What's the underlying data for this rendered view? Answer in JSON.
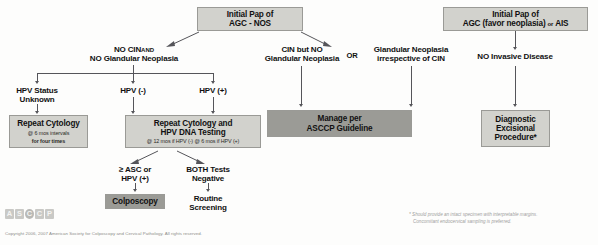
{
  "document": {
    "title": "Management of Women with Atypical Glandular Cells (AGC)",
    "type": "clinical-algorithm-flowchart"
  },
  "nodes": {
    "agc_nos": {
      "title_line1": "Initial Pap of",
      "title_line2": "AGC - NOS"
    },
    "agc_favor": {
      "title_line1": "Initial Pap of",
      "title_line2_a": "AGC (favor neoplasia)",
      "title_line2_or": "or",
      "title_line2_b": "AIS"
    },
    "repeat_cytology": {
      "title": "Repeat Cytology",
      "sub1": "@ 6 mos intervals",
      "sub2": "for four times"
    },
    "repeat_cytology_hpv": {
      "title_line1": "Repeat Cytology and",
      "title_line2": "HPV DNA Testing",
      "sub": "@ 12 mos if HPV (-)   @ 6 mos if HPV (+)"
    },
    "colposcopy": {
      "title": "Colposcopy"
    },
    "manage_asccp": {
      "title_line1": "Manage per",
      "title_line2": "ASCCP Guideline"
    },
    "diagnostic_excisional": {
      "title_line1": "Diagnostic",
      "title_line2": "Excisional",
      "title_line3": "Procedure*"
    }
  },
  "labels": {
    "no_cin": {
      "line1_a": "NO CIN",
      "line1_and": "AND",
      "line2": "NO Glandular Neoplasia"
    },
    "hpv_unknown": {
      "line1": "HPV Status",
      "line2": "Unknown"
    },
    "hpv_neg": {
      "text": "HPV (-)"
    },
    "hpv_pos": {
      "text": "HPV (+)"
    },
    "cin_but_no_gn": {
      "line1": "CIN but NO",
      "line2": "Glandular Neoplasia"
    },
    "or_connector": {
      "text": "OR"
    },
    "glandular_neoplasia": {
      "line1": "Glandular Neoplasia",
      "line2": "irrespective of CIN"
    },
    "no_invasive": {
      "text": "NO Invasive Disease"
    },
    "asc_or_hpv_pos": {
      "line1": "≥ ASC or",
      "line2": "HPV (+)"
    },
    "both_negative": {
      "line1": "BOTH Tests",
      "line2": "Negative"
    },
    "routine_screening": {
      "line1": "Routine",
      "line2": "Screening"
    }
  },
  "footer": {
    "logo_letters": [
      "A",
      "S",
      "C",
      "C",
      "P"
    ],
    "copyright": "Copyright 2006, 2007  American Society for Colposcopy and Cervical Pathology. All rights reserved.",
    "footnote_line1": "* Should provide an intact specimen with interpretable margins.",
    "footnote_line2": "Concomitant endocervical sampling is preferred."
  },
  "colors": {
    "box_light": "#d2d2cd",
    "box_dark": "#9b9b96",
    "box_border": "#9a9a96",
    "connector": "#55555a",
    "text": "#111111",
    "footer_text": "#8d8d8a"
  }
}
